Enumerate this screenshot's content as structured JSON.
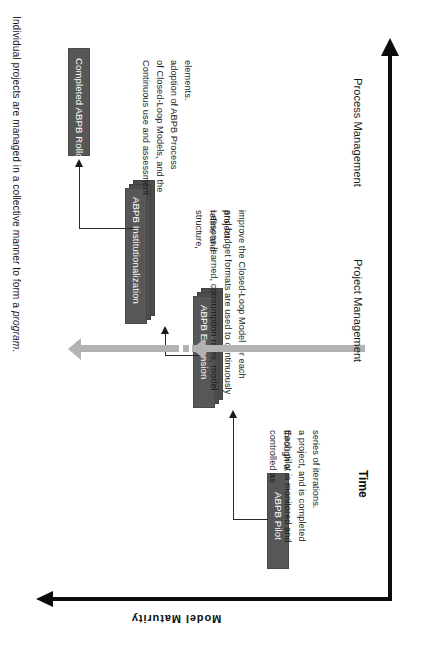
{
  "diagram": {
    "heading_plain": "Individual projects are managed in a collective manner to form a ",
    "heading_emphasis": "program",
    "heading_tail": ".",
    "heading_full": "Individual projects are managed in a collective manner to form a program."
  },
  "boxes": [
    {
      "id": "pilot",
      "label": "ABPB Pilot",
      "stacked": false
    },
    {
      "id": "expansion",
      "label": "ABPB Expansion",
      "stacked": true
    },
    {
      "id": "institutionalization",
      "label": "ABPB Institutionalization",
      "stacked": true
    },
    {
      "id": "rollout",
      "label": "Completed ABPB Rollout",
      "stacked": false
    }
  ],
  "annotations": [
    {
      "id": "pilot-note",
      "lines": [
        "Each pilot is monitored and controlled as",
        "a project, and is completed through a",
        "series of iterations."
      ]
    },
    {
      "id": "expansion-note",
      "lines": [
        "Lessons learned, consumption rates, model structure,",
        "and budget formats are used to continuously refine and",
        "improve the Closed-Loop Model for each project."
      ]
    },
    {
      "id": "institutionalization-note",
      "lines": [
        "Continuous use and assessment",
        "of Closed-Loop Models, and the",
        "adoption of ABPB Process",
        "elements."
      ]
    }
  ],
  "axes": {
    "vertical_label": "Model Maturity",
    "horizontal_label": "Time"
  },
  "management_arrows": [
    {
      "id": "project-management",
      "label": "Project Management",
      "dashed": false
    },
    {
      "id": "process-management",
      "label": "Process Management",
      "dashed": true
    }
  ],
  "colors": {
    "box_fill": "#575757",
    "box_stack": "#4d4d4d",
    "box_text": "#ffffff",
    "axis": "#0d0d0d",
    "connector": "#2b2b2b",
    "management_arrow": "#b3b3b3",
    "background": "#ffffff",
    "body_text": "#1a1a1a"
  }
}
